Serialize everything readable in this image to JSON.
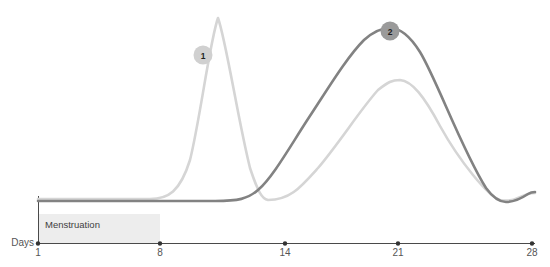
{
  "chart_data": {
    "type": "line",
    "title": "",
    "subtitle": "",
    "xlabel": "Days",
    "ylabel": "",
    "xlim": [
      1,
      28
    ],
    "ylim": [
      0,
      100
    ],
    "grid": false,
    "legend_position": "none",
    "x_ticks": [
      {
        "label": "1",
        "value": 1,
        "px": 38
      },
      {
        "label": "8",
        "value": 8,
        "px": 160
      },
      {
        "label": "14",
        "value": 14,
        "px": 285
      },
      {
        "label": "21",
        "value": 21,
        "px": 398
      },
      {
        "label": "28",
        "value": 28,
        "px": 532
      }
    ],
    "series": [
      {
        "name": "light-curve",
        "color": "#d5d5d5",
        "stroke_width": 2.6,
        "path": "M38,199 L150,199 C168,199 180,192 190,160 C200,120 210,40 218,18 C226,40 238,120 250,168 C258,192 262,199 268,200 C290,200 300,188 318,168 C340,142 360,110 378,90 C388,82 392,80 400,80 C412,81 424,96 440,126 C460,162 488,196 500,200 C506,201 512,201 518,198 C524,195 530,193 535,193",
        "points": [
          {
            "day": 1,
            "value": 8
          },
          {
            "day": 8,
            "value": 8
          },
          {
            "day": 11.5,
            "value": 92
          },
          {
            "day": 14.5,
            "value": 7
          },
          {
            "day": 21,
            "value": 56
          },
          {
            "day": 27,
            "value": 7
          },
          {
            "day": 28,
            "value": 11
          }
        ]
      },
      {
        "name": "dark-curve",
        "color": "#828282",
        "stroke_width": 2.6,
        "path": "M38,201 L215,201 C238,201 248,199 258,190 C272,178 288,150 306,122 C326,92 346,58 364,40 C374,31 382,28 390,28 C400,28 410,36 420,52 C436,78 462,150 486,188 C494,199 500,202 506,202 C514,202 522,198 528,194 C531,192 533,192 535,192",
        "points": [
          {
            "day": 1,
            "value": 7
          },
          {
            "day": 12,
            "value": 7
          },
          {
            "day": 16,
            "value": 40
          },
          {
            "day": 20.6,
            "value": 89
          },
          {
            "day": 26.8,
            "value": 6
          },
          {
            "day": 28,
            "value": 12
          }
        ]
      }
    ],
    "phases": [
      {
        "label": "Menstruation",
        "start_day": 1,
        "end_day": 8,
        "color": "#ededed"
      }
    ],
    "annotations": [
      {
        "label": "1",
        "cx": 203,
        "cy": 55,
        "r": 9.5,
        "color": "#d0d0d0",
        "on_series": "light-curve"
      },
      {
        "label": "2",
        "cx": 390,
        "cy": 31,
        "r": 9.5,
        "color": "#9a9a9a",
        "on_series": "dark-curve"
      }
    ]
  },
  "colors": {
    "axis": "#4a4a4a",
    "tick_label": "#555555",
    "band": "#ededed",
    "light_series": "#d5d5d5",
    "dark_series": "#828282"
  }
}
